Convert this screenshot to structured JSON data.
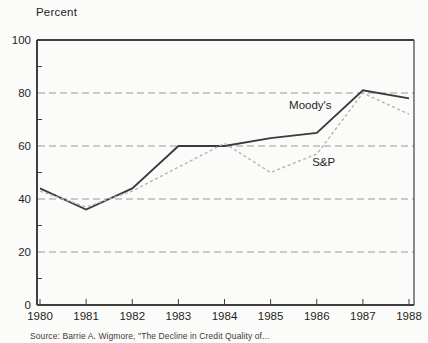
{
  "page": {
    "background": "#fbfbf9"
  },
  "axis_title": "Percent",
  "footer": {
    "source": "Source: Barrie A. Wigmore, \"The Decline in Credit Quality of..."
  },
  "chart_data": {
    "type": "line",
    "title": "",
    "xlabel": "",
    "ylabel": "Percent",
    "x": [
      1980,
      1981,
      1982,
      1983,
      1984,
      1985,
      1986,
      1987,
      1988
    ],
    "series": [
      {
        "name": "Moody's",
        "color": "#3a3a3a",
        "style": "solid",
        "width": 1.8,
        "values": [
          44,
          36,
          44,
          60,
          60,
          63,
          65,
          81,
          78
        ]
      },
      {
        "name": "S&P",
        "color": "#b4b4b4",
        "style": "dotted",
        "width": 1.4,
        "values": [
          43,
          37,
          43,
          52,
          61,
          50,
          57,
          80,
          72
        ]
      }
    ],
    "ylim": [
      0,
      100
    ],
    "yticks": [
      0,
      20,
      40,
      60,
      80,
      100
    ],
    "minor_yticks": [
      10,
      30,
      50,
      70,
      90
    ],
    "gridlines": {
      "style": "dashed",
      "color": "#9a9a9a",
      "at": [
        20,
        40,
        60,
        80
      ]
    },
    "legend_position": "inline-annotations",
    "annotations": [
      {
        "text": "Moody's",
        "x": 1985.4,
        "y": 75.5,
        "series": "Moody's"
      },
      {
        "text": "S&P",
        "x": 1985.9,
        "y": 54,
        "series": "S&P"
      }
    ],
    "frame_color": "#3f3f3f",
    "tick_label_color": "#1f1f1f"
  }
}
